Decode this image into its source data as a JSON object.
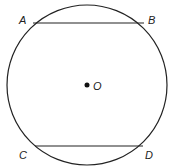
{
  "diagram": {
    "type": "circle-with-chords",
    "circle": {
      "cx": 87,
      "cy": 85,
      "r": 80,
      "stroke": "#222222"
    },
    "center": {
      "label": "O",
      "x": 87,
      "y": 85
    },
    "chords": [
      {
        "name": "AB",
        "from": "A",
        "to": "B",
        "x1": 33,
        "y1": 23,
        "x2": 144,
        "y2": 23
      },
      {
        "name": "CD",
        "from": "C",
        "to": "D",
        "x1": 35,
        "y1": 146,
        "x2": 143,
        "y2": 146
      }
    ],
    "points": [
      {
        "label": "A",
        "x": 19,
        "y": 24
      },
      {
        "label": "B",
        "x": 148,
        "y": 24
      },
      {
        "label": "C",
        "x": 19,
        "y": 159
      },
      {
        "label": "D",
        "x": 145,
        "y": 159
      }
    ]
  }
}
